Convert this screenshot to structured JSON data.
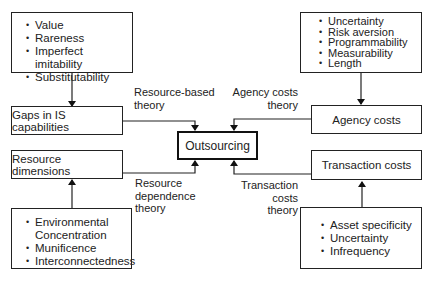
{
  "diagram": {
    "center": {
      "label": "Outsourcing"
    },
    "left_top": {
      "attributes": [
        "Value",
        "Rareness",
        "Imperfect imitability",
        "Substitutability"
      ],
      "node": "Gaps in IS capabilities",
      "theory_line1": "Resource-based",
      "theory_line2": "theory"
    },
    "right_top": {
      "attributes": [
        "Uncertainty",
        "Risk aversion",
        "Programmability",
        "Measurability",
        "Length"
      ],
      "node": "Agency costs",
      "theory_line1": "Agency costs",
      "theory_line2": "theory"
    },
    "left_bottom": {
      "attributes": [
        "Environmental",
        "Concentration",
        "Munificence",
        "Interconnectedness"
      ],
      "node": "Resource dimensions",
      "theory_line1": "Resource",
      "theory_line2": "dependence",
      "theory_line3": "theory"
    },
    "right_bottom": {
      "attributes": [
        "Asset specificity",
        "Uncertainty",
        "Infrequency"
      ],
      "node": "Transaction costs",
      "theory_line1": "Transaction",
      "theory_line2": "costs",
      "theory_line3": "theory"
    }
  }
}
